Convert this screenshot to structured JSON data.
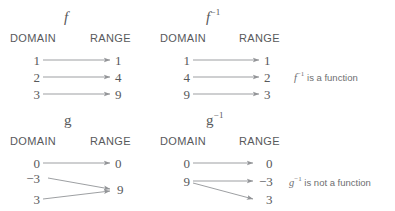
{
  "diagram": {
    "title_implicit": "Function and inverse function mapping diagrams",
    "column_headings": {
      "domain": "DOMAIN",
      "range": "RANGE"
    },
    "ink_color": "#58595b",
    "arrow_color": "#929497",
    "background": "#ffffff",
    "blocks": [
      {
        "id": "f",
        "label_base": "f",
        "label_exponent": "",
        "label_style": "italic",
        "domain_heading": "DOMAIN",
        "range_heading": "RANGE",
        "mappings": [
          {
            "domain": "1",
            "range": "1"
          },
          {
            "domain": "2",
            "range": "4"
          },
          {
            "domain": "3",
            "range": "9"
          }
        ]
      },
      {
        "id": "f-inverse",
        "label_base": "f",
        "label_exponent": "−1",
        "label_style": "italic",
        "domain_heading": "DOMAIN",
        "range_heading": "RANGE",
        "mappings": [
          {
            "domain": "1",
            "range": "1"
          },
          {
            "domain": "4",
            "range": "2"
          },
          {
            "domain": "9",
            "range": "3"
          }
        ]
      },
      {
        "id": "g",
        "label_base": "g",
        "label_exponent": "",
        "label_style": "upright",
        "domain_heading": "DOMAIN",
        "range_heading": "RANGE",
        "mappings": [
          {
            "domain": "0",
            "range": "0"
          },
          {
            "domain": "−3",
            "range": "9"
          },
          {
            "domain": "3",
            "range": "9"
          }
        ]
      },
      {
        "id": "g-inverse",
        "label_base": "g",
        "label_exponent": "−1",
        "label_style": "upright",
        "domain_heading": "DOMAIN",
        "range_heading": "RANGE",
        "mappings": [
          {
            "domain": "0",
            "range": "0"
          },
          {
            "domain": "9",
            "range": "−3"
          },
          {
            "domain": "9",
            "range": "3"
          }
        ]
      }
    ],
    "captions": [
      {
        "id": "f-inverse-caption",
        "symbol_base": "f",
        "symbol_exponent": "−1",
        "text": " is a function"
      },
      {
        "id": "g-inverse-caption",
        "symbol_base": "g",
        "symbol_exponent": "−1",
        "text": " is not a function"
      }
    ]
  }
}
